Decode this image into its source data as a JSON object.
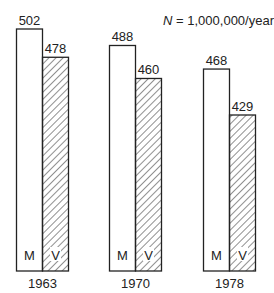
{
  "chart_data": {
    "type": "bar",
    "title": "",
    "annotation": "N = 1,000,000/year",
    "annotation_italic": "N",
    "annotation_rest": " = 1,000,000/year",
    "categories": [
      "1963",
      "1970",
      "1978"
    ],
    "series": [
      {
        "name": "M",
        "values": [
          502,
          488,
          468
        ],
        "pattern": "plain"
      },
      {
        "name": "V",
        "values": [
          478,
          460,
          429
        ],
        "pattern": "hatched"
      }
    ],
    "value_labels": {
      "M": [
        "502",
        "488",
        "468"
      ],
      "V": [
        "478",
        "460",
        "429"
      ]
    },
    "xlabel": "",
    "ylabel": "",
    "grid": false,
    "legend": "inline bar labels"
  }
}
